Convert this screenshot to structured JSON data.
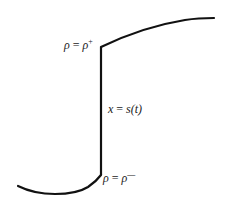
{
  "diagram": {
    "type": "shock-profile",
    "curve_color": "#111111",
    "background": "#ffffff",
    "labels": {
      "upper_state": {
        "lhs": "ρ",
        "eq": "=",
        "rhs": "ρ",
        "sup": "+"
      },
      "shock": {
        "lhs": "x",
        "eq": "=",
        "rhs": "s(t)"
      },
      "lower_state": {
        "lhs": "ρ",
        "eq": "=",
        "rhs": "ρ",
        "sup": "—"
      }
    }
  }
}
